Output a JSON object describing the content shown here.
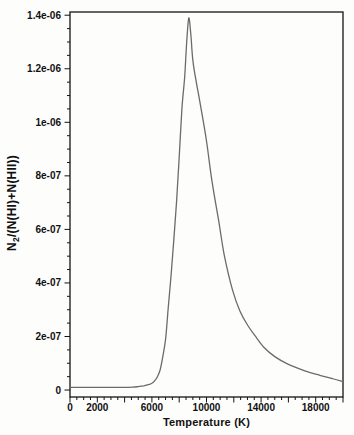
{
  "figure": {
    "background": "#fdfdfc",
    "frame_color": "#141414",
    "tick_color": "#141414",
    "text_color": "#111111",
    "curve_color": "#6b6b6b",
    "xlabel": "Temperature (K)",
    "ylabel_prefix": "N",
    "ylabel_sub": "2",
    "ylabel_suffix": "/(N(HI)+N(HII))",
    "ylabel_full": "N2/(N(HI)+N(HII))"
  },
  "chart_data": {
    "type": "line",
    "title": "",
    "xlabel": "Temperature (K)",
    "ylabel": "N2/(N(HI)+N(HII))",
    "legend": "none",
    "grid": false,
    "xlim": [
      0,
      20000
    ],
    "ylim": [
      -2.6e-08,
      1.412e-06
    ],
    "x_labeled_ticks": [
      {
        "value": 0,
        "label": "0"
      },
      {
        "value": 2000,
        "label": "2000"
      },
      {
        "value": 6000,
        "label": "6000"
      },
      {
        "value": 10000,
        "label": "10000"
      },
      {
        "value": 14000,
        "label": "14000"
      },
      {
        "value": 18000,
        "label": "18000"
      }
    ],
    "x_major_step": 2000,
    "x_minor_step": 500,
    "y_labeled_ticks": [
      {
        "value": 0,
        "label": "0"
      },
      {
        "value": 2e-07,
        "label": "2e-07"
      },
      {
        "value": 4e-07,
        "label": "4e-07"
      },
      {
        "value": 6e-07,
        "label": "6e-07"
      },
      {
        "value": 8e-07,
        "label": "8e-07"
      },
      {
        "value": 1e-06,
        "label": "1e-06"
      },
      {
        "value": 1.2e-06,
        "label": "1.2e-06"
      },
      {
        "value": 1.4e-06,
        "label": "1.4e-06"
      }
    ],
    "y_minor_step": 5e-08,
    "peak": {
      "x": 8700,
      "y": 1.39e-06
    },
    "series": [
      {
        "name": "N2/(N(HI)+N(HII)) vs Temperature",
        "x": [
          0,
          1000,
          2000,
          3000,
          4000,
          4600,
          5000,
          5400,
          5800,
          6000,
          6200,
          6400,
          6600,
          6800,
          7000,
          7200,
          7400,
          7600,
          7800,
          8000,
          8200,
          8400,
          8550,
          8700,
          8850,
          9000,
          9250,
          9500,
          10000,
          10400,
          10900,
          11300,
          11900,
          12450,
          13000,
          13550,
          14200,
          15000,
          16000,
          17200,
          18300,
          19200,
          20000
        ],
        "y": [
          1e-08,
          1e-08,
          1e-08,
          1e-08,
          1e-08,
          1.1e-08,
          1.3e-08,
          1.6e-08,
          2.1e-08,
          2.5e-08,
          3.4e-08,
          5e-08,
          7.5e-08,
          1.25e-07,
          1.9e-07,
          3.1e-07,
          4.25e-07,
          5.55e-07,
          7e-07,
          8.7e-07,
          1.05e-06,
          1.17e-06,
          1.3e-06,
          1.39e-06,
          1.33e-06,
          1.23e-06,
          1.15e-06,
          1.08e-06,
          9.3e-07,
          7.8e-07,
          6.3e-07,
          5.05e-07,
          3.75e-07,
          2.95e-07,
          2.43e-07,
          2.03e-07,
          1.6e-07,
          1.25e-07,
          9.6e-08,
          7.2e-08,
          5.5e-08,
          4.3e-08,
          3.2e-08
        ]
      }
    ]
  }
}
